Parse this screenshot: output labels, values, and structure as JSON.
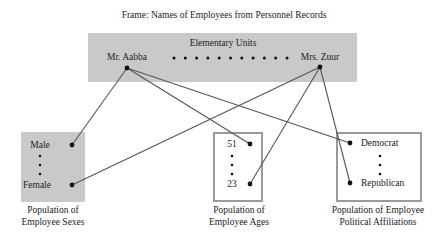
{
  "frame_title": "Frame: Names of Employees from Personnel Records",
  "elementary_units": {
    "title": "Elementary Units",
    "first": "Mr. Aabba",
    "last": "Mrs. Zuur",
    "ellipsis_dots": 11
  },
  "populations": [
    {
      "id": "sexes",
      "style": "shaded",
      "top_value": "Male",
      "bottom_value": "Female",
      "caption": [
        "Population of",
        "Employee Sexes"
      ]
    },
    {
      "id": "ages",
      "style": "outlined",
      "top_value": "51",
      "bottom_value": "23",
      "caption": [
        "Population of",
        "Employee Ages"
      ]
    },
    {
      "id": "political",
      "style": "outlined",
      "top_value": "Democrat",
      "bottom_value": "Republican",
      "caption": [
        "Population of Employee",
        "Political Affiliations"
      ]
    }
  ],
  "links": [
    {
      "from": "Mr. Aabba",
      "to": "Male"
    },
    {
      "from": "Mr. Aabba",
      "to": "51"
    },
    {
      "from": "Mr. Aabba",
      "to": "Democrat"
    },
    {
      "from": "Mrs. Zuur",
      "to": "Female"
    },
    {
      "from": "Mrs. Zuur",
      "to": "23"
    },
    {
      "from": "Mrs. Zuur",
      "to": "Republican"
    }
  ],
  "colors": {
    "shade": "#c9c9c9",
    "box_border": "#9a9a9a",
    "line": "#555555",
    "dot": "#111111"
  }
}
